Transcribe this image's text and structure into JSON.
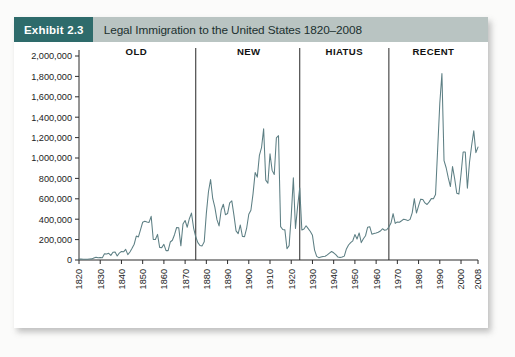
{
  "exhibit": {
    "badge_label": "Exhibit 2.3",
    "title": "Legal Immigration to the United States 1820–2008"
  },
  "colors": {
    "badge_background": "#2e6b6b",
    "header_background": "#b9c4c2",
    "series_line": "#5d7f84",
    "axis": "#2b2b2b",
    "divider": "#3a3a3a",
    "card_background": "#ffffff"
  },
  "chart_data": {
    "type": "line",
    "title": "Legal Immigration to the United States 1820–2008",
    "xlabel": "",
    "ylabel": "",
    "xlim": [
      1820,
      2008
    ],
    "ylim": [
      0,
      2000000
    ],
    "grid": false,
    "legend": "none",
    "ytick_labels": [
      "2,000,000",
      "1,800,000",
      "1,600,000",
      "1,400,000",
      "1,200,000",
      "1,000,000",
      "800,000",
      "600,000",
      "400,000",
      "200,000",
      "0"
    ],
    "ytick_values": [
      2000000,
      1800000,
      1600000,
      1400000,
      1200000,
      1000000,
      800000,
      600000,
      400000,
      200000,
      0
    ],
    "xtick_labels": [
      "1820",
      "1830",
      "1840",
      "1850",
      "1860",
      "1870",
      "1880",
      "1890",
      "1900",
      "1910",
      "1920",
      "1930",
      "1940",
      "1950",
      "1960",
      "1970",
      "1980",
      "1990",
      "2000",
      "2008"
    ],
    "xtick_values": [
      1820,
      1830,
      1840,
      1850,
      1860,
      1870,
      1880,
      1890,
      1900,
      1910,
      1920,
      1930,
      1940,
      1950,
      1960,
      1970,
      1980,
      1990,
      2000,
      2008
    ],
    "annotations": [
      {
        "label": "OLD",
        "span": [
          1820,
          1875
        ],
        "center": 1847
      },
      {
        "label": "NEW",
        "span": [
          1875,
          1924
        ],
        "center": 1900
      },
      {
        "label": "HIATUS",
        "span": [
          1924,
          1966
        ],
        "center": 1945
      },
      {
        "label": "RECENT",
        "span": [
          1966,
          2008
        ],
        "center": 1987
      }
    ],
    "divider_years": [
      1875,
      1924,
      1966
    ],
    "series": [
      {
        "name": "Legal immigrants admitted",
        "x": [
          1820,
          1821,
          1822,
          1823,
          1824,
          1825,
          1826,
          1827,
          1828,
          1829,
          1830,
          1831,
          1832,
          1833,
          1834,
          1835,
          1836,
          1837,
          1838,
          1839,
          1840,
          1841,
          1842,
          1843,
          1844,
          1845,
          1846,
          1847,
          1848,
          1849,
          1850,
          1851,
          1852,
          1853,
          1854,
          1855,
          1856,
          1857,
          1858,
          1859,
          1860,
          1861,
          1862,
          1863,
          1864,
          1865,
          1866,
          1867,
          1868,
          1869,
          1870,
          1871,
          1872,
          1873,
          1874,
          1875,
          1876,
          1877,
          1878,
          1879,
          1880,
          1881,
          1882,
          1883,
          1884,
          1885,
          1886,
          1887,
          1888,
          1889,
          1890,
          1891,
          1892,
          1893,
          1894,
          1895,
          1896,
          1897,
          1898,
          1899,
          1900,
          1901,
          1902,
          1903,
          1904,
          1905,
          1906,
          1907,
          1908,
          1909,
          1910,
          1911,
          1912,
          1913,
          1914,
          1915,
          1916,
          1917,
          1918,
          1919,
          1920,
          1921,
          1922,
          1923,
          1924,
          1925,
          1926,
          1927,
          1928,
          1929,
          1930,
          1931,
          1932,
          1933,
          1934,
          1935,
          1936,
          1937,
          1938,
          1939,
          1940,
          1941,
          1942,
          1943,
          1944,
          1945,
          1946,
          1947,
          1948,
          1949,
          1950,
          1951,
          1952,
          1953,
          1954,
          1955,
          1956,
          1957,
          1958,
          1959,
          1960,
          1961,
          1962,
          1963,
          1964,
          1965,
          1966,
          1967,
          1968,
          1969,
          1970,
          1971,
          1972,
          1973,
          1974,
          1975,
          1976,
          1977,
          1978,
          1979,
          1980,
          1981,
          1982,
          1983,
          1984,
          1985,
          1986,
          1987,
          1988,
          1989,
          1990,
          1991,
          1992,
          1993,
          1994,
          1995,
          1996,
          1997,
          1998,
          1999,
          2000,
          2001,
          2002,
          2003,
          2004,
          2005,
          2006,
          2007,
          2008
        ],
        "values": [
          8385,
          9127,
          6911,
          6354,
          7912,
          10199,
          10837,
          18875,
          27382,
          22520,
          23322,
          22633,
          60482,
          58640,
          65365,
          45374,
          76242,
          79340,
          38914,
          68069,
          84066,
          80289,
          104565,
          52496,
          78615,
          114371,
          154416,
          234968,
          226527,
          297024,
          369980,
          379466,
          371603,
          368645,
          427833,
          200877,
          200436,
          251306,
          123126,
          121282,
          153640,
          91918,
          91985,
          176282,
          193418,
          248120,
          318568,
          315722,
          138840,
          352768,
          387203,
          321350,
          404806,
          459803,
          313339,
          227498,
          169986,
          141857,
          138469,
          177826,
          457257,
          669431,
          788992,
          603322,
          518592,
          395346,
          334203,
          490109,
          546889,
          444427,
          455302,
          560319,
          579663,
          439730,
          285631,
          258536,
          343267,
          230832,
          229299,
          311715,
          448572,
          487918,
          648743,
          857046,
          812870,
          1026499,
          1100735,
          1285349,
          782870,
          751786,
          1041570,
          878587,
          838172,
          1197892,
          1218480,
          326700,
          298826,
          295403,
          110618,
          141132,
          430001,
          805228,
          309556,
          522919,
          706896,
          294314,
          304488,
          335175,
          307255,
          279678,
          241700,
          97139,
          35576,
          23068,
          29470,
          34956,
          36329,
          50244,
          67895,
          82998,
          70756,
          51776,
          28781,
          23725,
          28551,
          38119,
          108721,
          147292,
          170570,
          188317,
          249187,
          205717,
          265520,
          170434,
          208177,
          237790,
          321625,
          326867,
          253265,
          260686,
          265398,
          271344,
          283763,
          306260,
          292248,
          296697,
          323040,
          361972,
          454448,
          358579,
          373326,
          370478,
          384685,
          400063,
          394861,
          386194,
          398613,
          462315,
          601442,
          460348,
          530639,
          596600,
          594131,
          559763,
          543903,
          570009,
          601708,
          601516,
          643025,
          1090924,
          1536483,
          1827167,
          973977,
          904292,
          804416,
          720461,
          915900,
          798378,
          654451,
          646568,
          841002,
          1058902,
          1059356,
          703542,
          957883,
          1122257,
          1266129,
          1052415,
          1107126
        ]
      }
    ]
  }
}
